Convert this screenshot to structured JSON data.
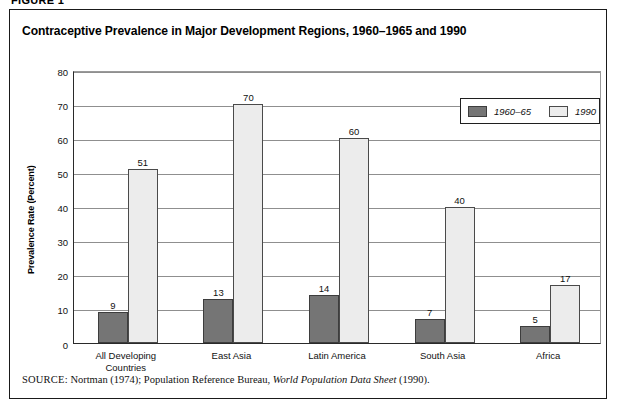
{
  "figure": {
    "label": "FIGURE 1",
    "title": "Contraceptive Prevalence in Major Development Regions, 1960–1965 and 1990"
  },
  "source": {
    "kicker": "SOURCE:",
    "text_before": "Nortman (1974); Population Reference Bureau,",
    "italic_title": "World Population Data Sheet",
    "text_after": "(1990)."
  },
  "legend": {
    "position": "top-right-inside",
    "entries": [
      {
        "label": "1960–65",
        "color": "#757575"
      },
      {
        "label": "1990",
        "color": "#ececec"
      }
    ]
  },
  "chart_data": {
    "type": "bar",
    "title": "Contraceptive Prevalence in Major Development Regions, 1960–1965 and 1990",
    "xlabel": "",
    "ylabel": "Prevalence Rate (Percent)",
    "ylim": [
      0,
      80
    ],
    "yticks": [
      0,
      10,
      20,
      30,
      40,
      50,
      60,
      70,
      80
    ],
    "grid": true,
    "legend_position": "upper right",
    "categories": [
      "All Developing\nCountries",
      "East Asia",
      "Latin America",
      "South Asia",
      "Africa"
    ],
    "series": [
      {
        "name": "1960–65",
        "color": "#757575",
        "values": [
          9,
          13,
          14,
          7,
          5
        ]
      },
      {
        "name": "1990",
        "color": "#ececec",
        "values": [
          51,
          70,
          60,
          40,
          17
        ]
      }
    ]
  }
}
